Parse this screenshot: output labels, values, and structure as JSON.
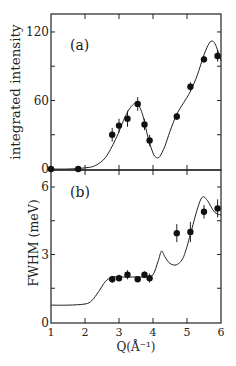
{
  "chart_data": [
    {
      "panel_label": "(a)",
      "type": "scatter",
      "title": "",
      "xlabel": "",
      "ylabel": "integrated intensity",
      "xlim": [
        1,
        6
      ],
      "ylim": [
        0,
        135
      ],
      "yticks": [
        "0",
        "60",
        "120"
      ],
      "grid": false,
      "series": [
        {
          "name": "data",
          "x": [
            1.0,
            1.8,
            2.8,
            3.0,
            3.25,
            3.55,
            3.75,
            3.9,
            4.7,
            5.1,
            5.5,
            5.9
          ],
          "y": [
            0,
            0,
            30,
            38,
            44,
            57,
            39,
            25,
            46,
            72,
            96,
            99
          ],
          "yerr": [
            1,
            2,
            6,
            6,
            7,
            6,
            5,
            5,
            3,
            4,
            3,
            5
          ]
        },
        {
          "name": "fit",
          "x": [
            1.0,
            1.5,
            2.0,
            2.3,
            2.6,
            2.9,
            3.2,
            3.4,
            3.55,
            3.7,
            3.85,
            4.0,
            4.1,
            4.2,
            4.35,
            4.5,
            4.7,
            4.9,
            5.1,
            5.3,
            5.5,
            5.65,
            5.75,
            5.85,
            6.0
          ],
          "y": [
            0,
            0,
            1,
            3,
            10,
            26,
            47,
            56,
            57,
            47,
            28,
            14,
            10,
            11,
            20,
            33,
            48,
            58,
            68,
            82,
            100,
            110,
            112,
            108,
            95
          ]
        }
      ]
    },
    {
      "panel_label": "(b)",
      "type": "scatter",
      "title": "",
      "xlabel": "Q(Å⁻¹)",
      "ylabel": "FWHM (meV)",
      "xlim": [
        1,
        6
      ],
      "ylim": [
        0,
        6.7
      ],
      "xticks": [
        "1",
        "2",
        "3",
        "4",
        "5",
        "6"
      ],
      "yticks": [
        "0",
        "3",
        "6"
      ],
      "grid": false,
      "series": [
        {
          "name": "data",
          "x": [
            2.8,
            3.0,
            3.25,
            3.55,
            3.75,
            3.9,
            4.7,
            5.1,
            5.5,
            5.9
          ],
          "y": [
            1.9,
            1.95,
            2.1,
            1.9,
            2.1,
            1.95,
            3.95,
            4.0,
            4.9,
            5.05
          ],
          "yerr": [
            0.15,
            0.15,
            0.2,
            0.1,
            0.15,
            0.2,
            0.4,
            0.45,
            0.3,
            0.4
          ]
        },
        {
          "name": "fit",
          "x": [
            1.0,
            1.5,
            2.0,
            2.2,
            2.4,
            2.6,
            2.8,
            3.0,
            3.5,
            3.8,
            4.0,
            4.15,
            4.25,
            4.35,
            4.5,
            4.7,
            4.9,
            5.1,
            5.3,
            5.45,
            5.6,
            5.8,
            6.0
          ],
          "y": [
            0.75,
            0.75,
            0.8,
            0.95,
            1.35,
            1.8,
            2.0,
            2.0,
            2.0,
            2.0,
            2.1,
            2.7,
            3.15,
            2.9,
            2.6,
            2.55,
            2.9,
            3.9,
            5.0,
            5.55,
            5.4,
            4.9,
            4.75
          ]
        }
      ]
    }
  ],
  "labels": {
    "panel_a": "(a)",
    "panel_b": "(b)",
    "ylabel_a": "integrated intensity",
    "ylabel_b": "FWHM (meV)",
    "xlabel": "Q(Å⁻¹)",
    "yticks_a": [
      "0",
      "60",
      "120"
    ],
    "yticks_b": [
      "0",
      "3",
      "6"
    ],
    "xticks": [
      "1",
      "2",
      "3",
      "4",
      "5",
      "6"
    ]
  }
}
